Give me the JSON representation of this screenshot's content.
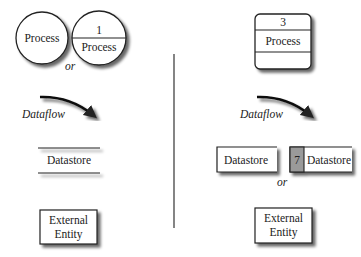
{
  "left_panel": {
    "process_simple_label": "Process",
    "process_numbered_id": "1",
    "process_numbered_label": "Process",
    "or_1": "or",
    "dataflow_label": "Dataflow",
    "datastore_label": "Datastore",
    "external_entity_line1": "External",
    "external_entity_line2": "Entity"
  },
  "right_panel": {
    "process_id": "3",
    "process_label": "Process",
    "dataflow_label": "Dataflow",
    "datastore_simple_label": "Datastore",
    "datastore_id": "7",
    "datastore_numbered_label": "Datastore",
    "or_2": "or",
    "external_entity_line1": "External",
    "external_entity_line2": "Entity"
  },
  "colors": {
    "stroke": "#222222",
    "shadow": "#9a9a9a",
    "datastore_id_fill": "#9a9a9a"
  }
}
